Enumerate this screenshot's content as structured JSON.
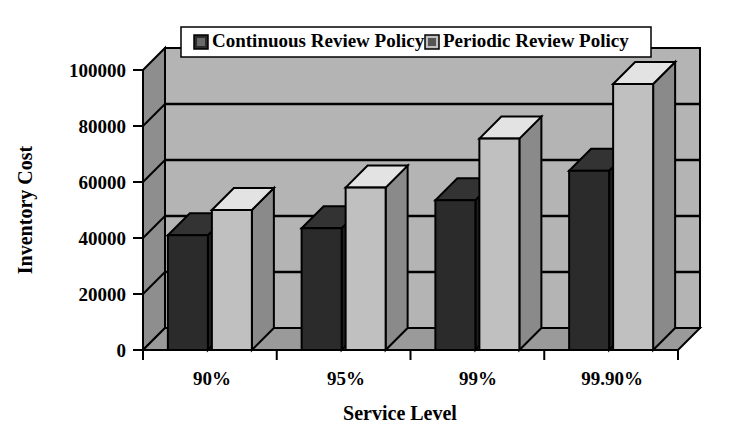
{
  "chart_data": {
    "type": "bar",
    "title": "",
    "xlabel": "Service Level",
    "ylabel": "Inventory Cost",
    "categories": [
      "90%",
      "95%",
      "99%",
      "99.90%"
    ],
    "series": [
      {
        "name": "Continuous Review Policy",
        "values": [
          41000,
          43500,
          53500,
          64000
        ],
        "color": "#2b2b2b"
      },
      {
        "name": "Periodic Review Policy",
        "values": [
          50000,
          58000,
          75500,
          95000
        ],
        "color": "#c0c0c0"
      }
    ],
    "ylim": [
      0,
      100000
    ],
    "yticks": [
      0,
      20000,
      40000,
      60000,
      80000,
      100000
    ],
    "ytick_labels": [
      "0",
      "20000",
      "40000",
      "60000",
      "80000",
      "100000"
    ],
    "grid": true,
    "grid_axis": "y",
    "legend_position": "top-center",
    "style": "3d-column",
    "plot_background": "#b4b4b4",
    "wall_shade": "#8e8e8e",
    "floor_shade": "#9a9a9a",
    "border_color": "#000000",
    "page_background": "#ffffff"
  },
  "legend": {
    "entries": [
      {
        "label": "Continuous Review Policy",
        "swatch": "#2b2b2b",
        "marker_name": "legend-swatch-continuous"
      },
      {
        "label": "Periodic Review Policy",
        "swatch": "#c0c0c0",
        "marker_name": "legend-swatch-periodic"
      }
    ]
  },
  "axes": {
    "y_title": "Inventory Cost",
    "x_title": "Service Level",
    "y_tick_0": "0",
    "y_tick_1": "20000",
    "y_tick_2": "40000",
    "y_tick_3": "60000",
    "y_tick_4": "80000",
    "y_tick_5": "100000",
    "x_cat_0": "90%",
    "x_cat_1": "95%",
    "x_cat_2": "99%",
    "x_cat_3": "99.90%"
  }
}
